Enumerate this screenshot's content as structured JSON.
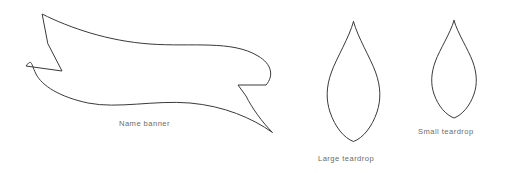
{
  "canvas": {
    "width": 519,
    "height": 173,
    "background_color": "#ffffff",
    "stroke_color": "#3a3a3a",
    "caption_color": "#6b6b6b"
  },
  "shapes": [
    {
      "id": "name-banner",
      "caption": "Name banner",
      "kind": "ribbon-banner",
      "bounds": {
        "x": 26,
        "y": 14,
        "width": 247,
        "height": 119
      }
    },
    {
      "id": "large-teardrop",
      "caption": "Large teardrop",
      "kind": "teardrop",
      "bounds": {
        "x": 326,
        "y": 21,
        "width": 54,
        "height": 121
      }
    },
    {
      "id": "small-teardrop",
      "caption": "Small teardrop",
      "kind": "teardrop",
      "bounds": {
        "x": 430,
        "y": 20,
        "width": 48,
        "height": 98
      }
    }
  ]
}
